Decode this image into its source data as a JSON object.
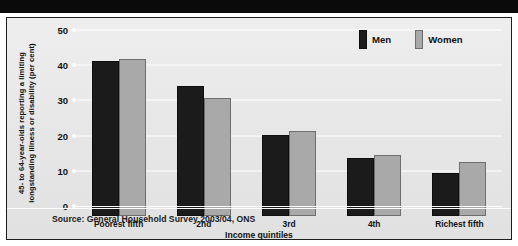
{
  "chart_data": {
    "type": "bar",
    "title": "",
    "subtitle": "",
    "xlabel": "Income quintiles",
    "ylabel": "45- to 64-year-olds reporting a limiting longstanding illness or disability (per cent)",
    "ylabel_lines": [
      "45- to 64-year-olds reporting a limiting",
      "longstanding illness or disability (per cent)"
    ],
    "categories": [
      "Poorest fifth",
      "2nd",
      "3rd",
      "4th",
      "Richest fifth"
    ],
    "series": [
      {
        "name": "Men",
        "color": "#1b1b1b",
        "values": [
          44.0,
          36.8,
          23.1,
          16.4,
          12.3
        ]
      },
      {
        "name": "Women",
        "color": "#a9a9a9",
        "values": [
          44.5,
          33.4,
          24.2,
          17.3,
          15.3
        ]
      }
    ],
    "ylim": [
      0,
      50
    ],
    "yticks": [
      0,
      10,
      20,
      30,
      40,
      50
    ],
    "ytick_labels": [
      "0",
      "10",
      "20",
      "30",
      "40",
      "50"
    ],
    "grid": true,
    "grid_color": "#ffffff",
    "legend_position": "top-right",
    "source": "Source: General Household Survey 2003/04, ONS",
    "background": "#e8e8e8",
    "frame_color": "#1d1d1d"
  }
}
